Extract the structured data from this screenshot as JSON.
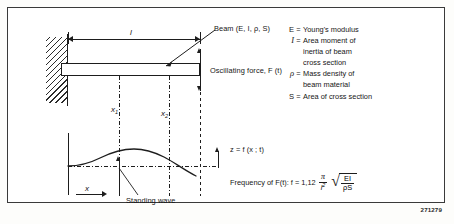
{
  "figure": {
    "reference_number": "271279",
    "diagram": {
      "length_label": "l",
      "beam_label": "Beam  (E, I, ρ, S)",
      "force_label": "Oscillating force,  F (t)",
      "position_1": "x",
      "position_1_sub": "1",
      "position_2": "x",
      "position_2_sub": "2",
      "axis_label": "x",
      "wave_label": "Standing wave",
      "deflection_label": "z = f (x ; t)"
    },
    "legend": {
      "items": [
        {
          "symbol": "E",
          "equals": "=",
          "text": "Young's modulus"
        },
        {
          "symbol": "I",
          "equals": "=",
          "text": "Area moment of"
        },
        {
          "symbol": "",
          "equals": "",
          "text": "inertia of beam"
        },
        {
          "symbol": "",
          "equals": "",
          "text": "cross section"
        },
        {
          "symbol": "ρ",
          "equals": "=",
          "text": "Mass density of"
        },
        {
          "symbol": "",
          "equals": "",
          "text": "beam material"
        },
        {
          "symbol": "S",
          "equals": "=",
          "text": "Area of cross section"
        }
      ]
    },
    "formula": {
      "prefix": "Frequency of F(t):  f  =  1,12",
      "fraction_numerator": "π",
      "fraction_denominator_base": "l",
      "fraction_denominator_exp": "2",
      "radical_numerator": "EI",
      "radical_denominator": "ρS"
    }
  }
}
